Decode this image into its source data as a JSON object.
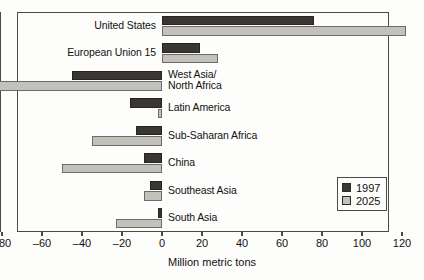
{
  "chart_data": {
    "type": "bar",
    "orientation": "horizontal",
    "title": "",
    "xlabel": "Million metric tons",
    "ylabel": "",
    "xlim": [
      -80,
      120
    ],
    "xticks": [
      -80,
      -60,
      -40,
      -20,
      0,
      20,
      40,
      60,
      80,
      100,
      120
    ],
    "xtick_labels": [
      "–80",
      "–60",
      "–40",
      "–20",
      "0",
      "20",
      "40",
      "60",
      "80",
      "100",
      "120"
    ],
    "grid": false,
    "legend_position": "lower-right",
    "categories": [
      "United States",
      "European Union 15",
      "West Asia/\nNorth Africa",
      "Latin America",
      "Sub-Saharan Africa",
      "China",
      "Southeast Asia",
      "South Asia"
    ],
    "series": [
      {
        "name": "1997",
        "color": "#3a3732",
        "values": [
          76,
          19,
          -45,
          -16,
          -13,
          -9,
          -6,
          -2
        ]
      },
      {
        "name": "2025",
        "color": "#c2c1bb",
        "values": [
          122,
          28,
          -82,
          -2,
          -35,
          -50,
          -9,
          -23
        ]
      }
    ]
  },
  "legend": {
    "items": [
      {
        "label": "1997",
        "swatch": "legend-swatch-1997"
      },
      {
        "label": "2025",
        "swatch": "legend-swatch-2025"
      }
    ]
  },
  "axis": {
    "title": "Million metric tons"
  }
}
